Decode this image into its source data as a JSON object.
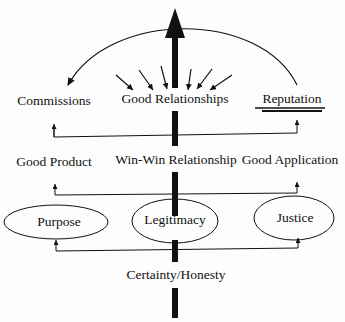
{
  "diagram": {
    "top_row": {
      "left": "Commissions",
      "center": "Good Relationships",
      "right": "Reputation"
    },
    "middle_row": {
      "left": "Good Product",
      "center": "Win-Win Relationship",
      "right": "Good Application"
    },
    "ellipses": {
      "left": "Purpose",
      "center": "Legitimacy",
      "right": "Justice"
    },
    "base": "Certainty/Honesty",
    "colors": {
      "ink": "#111111",
      "background": "#fdfdfd"
    }
  }
}
